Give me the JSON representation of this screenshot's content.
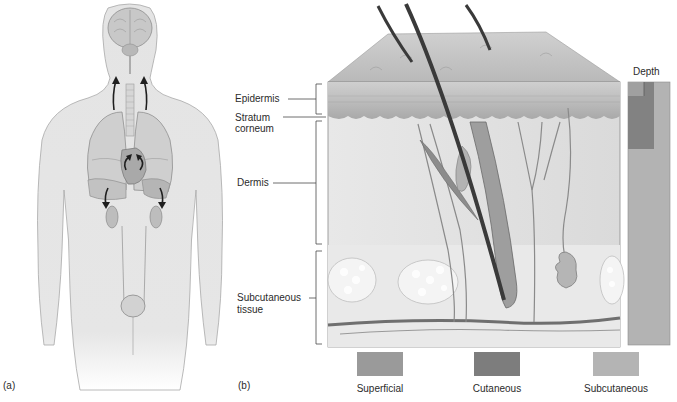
{
  "panels": {
    "a": {
      "label": "(a)"
    },
    "b": {
      "label": "(b)"
    }
  },
  "skin_layers": {
    "epidermis": "Epidermis",
    "stratum_corneum_line1": "Stratum",
    "stratum_corneum_line2": "corneum",
    "dermis": "Dermis",
    "subcutaneous_line1": "Subcutaneous",
    "subcutaneous_line2": "tissue"
  },
  "depth_bar": {
    "title": "Depth"
  },
  "legend": [
    {
      "label": "Superficial",
      "color": "#9a9a9a"
    },
    {
      "label": "Cutaneous",
      "color": "#7d7d7d"
    },
    {
      "label": "Subcutaneous",
      "color": "#b4b4b4"
    }
  ],
  "colors": {
    "body_fill": "#e6e6e6",
    "organ_fill": "#c9c9c9",
    "skin_top": "#c4c4c4",
    "dermis_fill": "#e3e3e3",
    "hair": "#3a3a3a"
  }
}
